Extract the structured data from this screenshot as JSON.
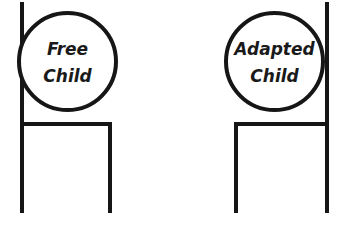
{
  "diagram": {
    "type": "transactional-analysis-ego-states",
    "background_color": "#ffffff",
    "stroke_color": "#161616",
    "text_color": "#1a1a1a",
    "canvas": {
      "width": 344,
      "height": 235
    },
    "groups": [
      {
        "key": "free_child",
        "label_line1": "Free",
        "label_line2": "Child",
        "circle": {
          "cx": 67.5,
          "cy": 61.5,
          "r": 48.5,
          "stroke_width": 4
        },
        "label_x": 67.5,
        "label_line1_y": 50,
        "label_line2_y": 77,
        "font_size": 17,
        "rail": {
          "x": 22,
          "y1": 2,
          "y2": 213,
          "stroke_width": 4
        },
        "crossbar": {
          "x1": 22,
          "x2": 112,
          "y": 124,
          "stroke_width": 4
        },
        "drop": {
          "x": 110,
          "y1": 124,
          "y2": 213,
          "stroke_width": 4
        }
      },
      {
        "key": "adapted_child",
        "label_line1": "Adapted",
        "label_line2": "Child",
        "circle": {
          "cx": 274.5,
          "cy": 61.5,
          "r": 48.5,
          "stroke_width": 4
        },
        "label_x": 274.5,
        "label_line1_y": 50,
        "label_line2_y": 77,
        "font_size": 17,
        "rail": {
          "x": 327,
          "y1": 2,
          "y2": 213,
          "stroke_width": 4
        },
        "crossbar": {
          "x1": 234,
          "x2": 327,
          "y": 124,
          "stroke_width": 4
        },
        "drop": {
          "x": 236,
          "y1": 124,
          "y2": 213,
          "stroke_width": 4
        }
      }
    ]
  }
}
